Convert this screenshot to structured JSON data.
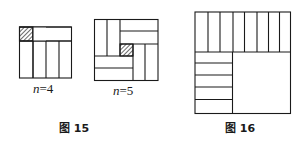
{
  "figure15": {
    "caption": "图 15",
    "panels": [
      {
        "id": "n4",
        "label_var": "n",
        "label_rest": "=4"
      },
      {
        "id": "n5",
        "label_var": "n",
        "label_rest": "=5"
      }
    ]
  },
  "figure16": {
    "caption": "图 16"
  },
  "colors": {
    "stroke": "#1a1a1a",
    "background": "#ffffff"
  }
}
